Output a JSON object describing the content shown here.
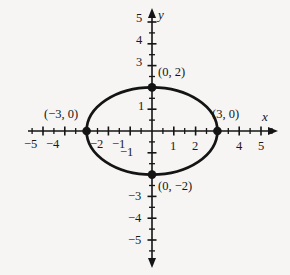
{
  "figure": {
    "background_color": "#f6f5f3",
    "ink_color": "#141414"
  },
  "axes": {
    "x_axis_name": "x",
    "y_axis_name": "y",
    "xlim": [
      -5.6,
      5.6
    ],
    "ylim": [
      -5.6,
      5.6
    ],
    "minor_tick_step": 0.5,
    "major_tick_step": 1,
    "grid": false
  },
  "x_tick_labels": [
    {
      "value": -5,
      "text": "−5"
    },
    {
      "value": -4,
      "text": "−4"
    },
    {
      "value": -2,
      "text": "−2"
    },
    {
      "value": -1,
      "text": "−1"
    },
    {
      "value": 1,
      "text": "1"
    },
    {
      "value": 2,
      "text": "2"
    },
    {
      "value": 4,
      "text": "4"
    },
    {
      "value": 5,
      "text": "5"
    }
  ],
  "y_tick_labels": [
    {
      "value": 5,
      "text": "5"
    },
    {
      "value": 4,
      "text": "4"
    },
    {
      "value": 3,
      "text": "3"
    },
    {
      "value": 1,
      "text": "1"
    },
    {
      "value": -1,
      "text": "−1"
    },
    {
      "value": -3,
      "text": "−3"
    },
    {
      "value": -4,
      "text": "−4"
    },
    {
      "value": -5,
      "text": "−5"
    }
  ],
  "point_labels": [
    {
      "id": "top-vertex",
      "text": "(0, 2)"
    },
    {
      "id": "left-vertex",
      "text": "(−3, 0)"
    },
    {
      "id": "right-vertex",
      "text": "(3, 0)"
    },
    {
      "id": "bottom-vertex",
      "text": "(0, −2)"
    }
  ],
  "chart_data": {
    "type": "line",
    "title": "",
    "xlabel": "x",
    "ylabel": "y",
    "xlim": [
      -5.6,
      5.6
    ],
    "ylim": [
      -5.6,
      5.6
    ],
    "grid": false,
    "curve": {
      "name": "ellipse",
      "shape": "ellipse",
      "center": [
        0,
        0
      ],
      "semi_axis_x": 3,
      "semi_axis_y": 2,
      "equation": "x^2/9 + y^2/4 = 1"
    },
    "marked_points": [
      {
        "x": 0,
        "y": 2,
        "label": "(0, 2)"
      },
      {
        "x": -3,
        "y": 0,
        "label": "(−3, 0)"
      },
      {
        "x": 3,
        "y": 0,
        "label": "(3, 0)"
      },
      {
        "x": 0,
        "y": -2,
        "label": "(0, −2)"
      }
    ]
  }
}
